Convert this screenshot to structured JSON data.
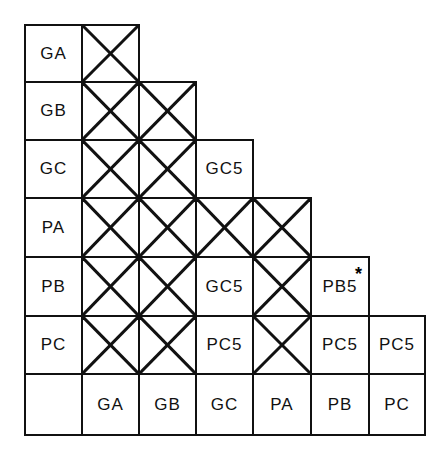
{
  "diagram": {
    "type": "triangular-interaction-matrix",
    "row_headers": [
      "GA",
      "GB",
      "GC",
      "PA",
      "PB",
      "PC"
    ],
    "column_headers": [
      "GA",
      "GB",
      "GC",
      "PA",
      "PB",
      "PC"
    ],
    "crossed_symbol": "X",
    "rows": [
      {
        "header": "GA",
        "cells": [
          "X"
        ]
      },
      {
        "header": "GB",
        "cells": [
          "X",
          "X"
        ]
      },
      {
        "header": "GC",
        "cells": [
          "X",
          "X",
          "GC5"
        ]
      },
      {
        "header": "PA",
        "cells": [
          "X",
          "X",
          "X",
          "X"
        ]
      },
      {
        "header": "PB",
        "cells": [
          "X",
          "X",
          "GC5",
          "X",
          "PB5*"
        ]
      },
      {
        "header": "PC",
        "cells": [
          "X",
          "X",
          "PC5",
          "X",
          "PC5",
          "PC5"
        ]
      }
    ],
    "labels": {
      "r0": "GA",
      "r1": "GB",
      "r2": "GC",
      "r3": "PA",
      "r4": "PB",
      "r5": "PC",
      "c0": "GA",
      "c1": "GB",
      "c2": "GC",
      "c3": "PA",
      "c4": "PB",
      "c5": "PC",
      "gc_gc": "GC5",
      "pb_gc": "GC5",
      "pb_pb": "PB5",
      "pb_pb_mark": "*",
      "pc_gc": "PC5",
      "pc_pb": "PC5",
      "pc_pc": "PC5"
    }
  }
}
